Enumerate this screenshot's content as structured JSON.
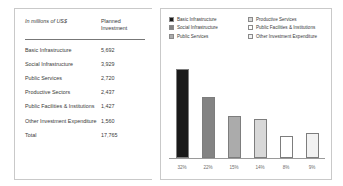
{
  "table": {
    "header_label": "In millions of US$",
    "header_value": "Planned Investment",
    "header_value_line1": "Planned",
    "header_value_line2": "Investment",
    "rows": [
      {
        "label": "Basic Infrastructure",
        "value": "5,692"
      },
      {
        "label": "Social Infrastructure",
        "value": "3,929"
      },
      {
        "label": "Public Services",
        "value": "2,720"
      },
      {
        "label": "Productive Sectors",
        "value": "2,437"
      },
      {
        "label": "Public Facilities & Institutions",
        "value": "1,427"
      },
      {
        "label": "Other Investment Expenditure",
        "value": "1,560"
      }
    ],
    "total": {
      "label": "Total",
      "value": "17,765"
    }
  },
  "legend": {
    "items": [
      {
        "label": "Basic Infrastructure",
        "color": "#1a1a1a"
      },
      {
        "label": "Productive Services",
        "color": "#d8d8d8"
      },
      {
        "label": "Social Infrastructure",
        "color": "#838383"
      },
      {
        "label": "Public Facilities & Institutions",
        "color": "#ffffff"
      },
      {
        "label": "Public Services",
        "color": "#ababab"
      },
      {
        "label": "Other Investment Expenditure",
        "color": "#f2f2f2"
      }
    ]
  },
  "chart_data": {
    "type": "bar",
    "title": "",
    "xlabel": "",
    "ylabel": "",
    "categories": [
      "Basic Infrastructure",
      "Social Infrastructure",
      "Public Services",
      "Productive Services",
      "Public Facilities & Institutions",
      "Other Investment Expenditure"
    ],
    "values": [
      32,
      22,
      15,
      14,
      8,
      9
    ],
    "value_labels": [
      "32%",
      "22%",
      "15%",
      "14%",
      "8%",
      "9%"
    ],
    "colors": [
      "#1a1a1a",
      "#838383",
      "#ababab",
      "#d8d8d8",
      "#ffffff",
      "#f2f2f2"
    ],
    "ylim": [
      0,
      35
    ],
    "grid": false,
    "legend_position": "top"
  }
}
